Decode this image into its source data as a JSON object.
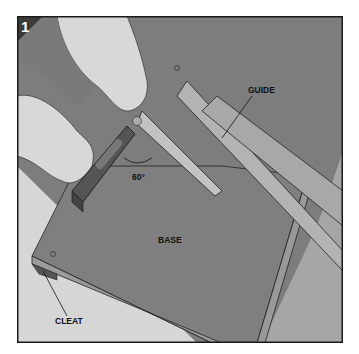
{
  "figure": {
    "step_number": "1",
    "labels": {
      "guide": "GUIDE",
      "angle": "60°",
      "base": "BASE",
      "cleat": "CLEAT"
    },
    "colors": {
      "background": "#ffffff",
      "frame_border": "#1a1a1a",
      "panel_dark": "#777777",
      "panel_mid": "#8c8c8c",
      "strip_light": "#a9a9a9",
      "skin": "#dcdcdc",
      "badge": "#3a3a3a"
    }
  }
}
